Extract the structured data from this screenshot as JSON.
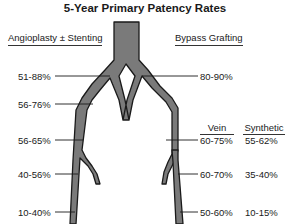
{
  "title": "5-Year Primary Patency Rates",
  "left_section": {
    "header": "Angioplasty ± Stenting",
    "labels": [
      "51-88%",
      "56-76%",
      "56-65%",
      "40-56%",
      "10-40%"
    ]
  },
  "right_section": {
    "header": "Bypass Grafting",
    "top_label": "80-90%",
    "columns": [
      "Vein",
      "Synthetic"
    ],
    "rows": [
      {
        "vein": "60-75%",
        "synthetic": "55-62%"
      },
      {
        "vein": "60-70%",
        "synthetic": "35-40%"
      },
      {
        "vein": "50-60%",
        "synthetic": "10-15%"
      }
    ]
  },
  "colors": {
    "vessel_fill": "#7a7a7a",
    "vessel_outline": "#1a1a1a",
    "text": "#1a1a1a",
    "background": "#ffffff"
  }
}
